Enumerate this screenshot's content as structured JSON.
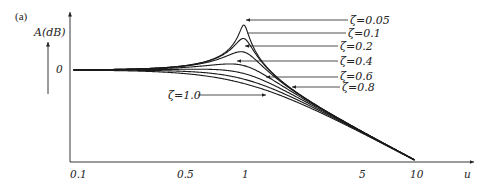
{
  "chart_data": {
    "type": "line",
    "panel_label": "(a)",
    "title": "",
    "xlabel": "u",
    "ylabel": "A(dB)",
    "x_scale": "log",
    "x_ticks": [
      "0.1",
      "0.5",
      "1",
      "5",
      "10"
    ],
    "x_tick_values": [
      0.1,
      0.5,
      1,
      5,
      10
    ],
    "y_ticks": [
      "0"
    ],
    "xlim": [
      0.1,
      10
    ],
    "grid": false,
    "legend_position": "inline-right-with-arrows",
    "series": [
      {
        "name": "ζ=0.05",
        "zeta": 0.05,
        "peak_db": 20.0
      },
      {
        "name": "ζ=0.1",
        "zeta": 0.1,
        "peak_db": 14.0
      },
      {
        "name": "ζ=0.2",
        "zeta": 0.2,
        "peak_db": 8.1
      },
      {
        "name": "ζ=0.4",
        "zeta": 0.4,
        "peak_db": 2.7
      },
      {
        "name": "ζ=0.6",
        "zeta": 0.6,
        "peak_db": 0.0
      },
      {
        "name": "ζ=0.8",
        "zeta": 0.8,
        "peak_db": 0.0
      },
      {
        "name": "ζ=1.0",
        "zeta": 1.0,
        "peak_db": 0.0
      }
    ],
    "asymptote": "-40 dB/decade above u=1"
  },
  "labels": {
    "panel": "(a)",
    "y_axis": "A(dB)",
    "y_zero": "0",
    "x_axis": "u",
    "x_ticks": [
      "0.1",
      "0.5",
      "1",
      "5",
      "10"
    ],
    "zeta": [
      "ζ=0.05",
      "ζ=0.1",
      "ζ=0.2",
      "ζ=0.4",
      "ζ=0.6",
      "ζ=0.8",
      "ζ=1.0"
    ]
  }
}
